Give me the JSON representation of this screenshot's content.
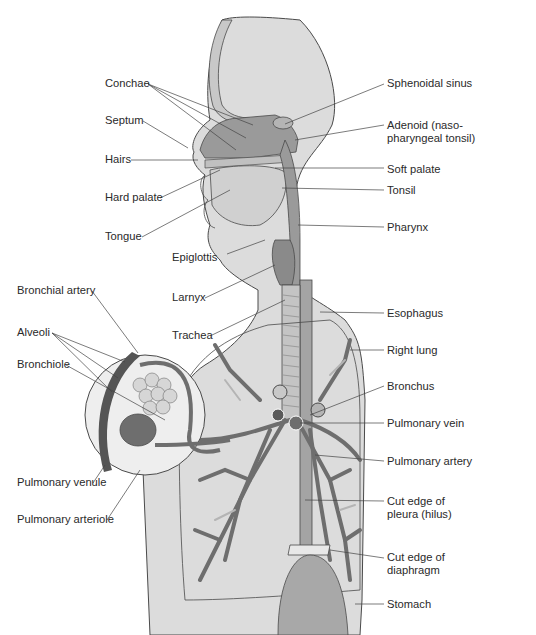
{
  "figure": {
    "colors": {
      "body_fill": "#dcdcdc",
      "outline": "#4a4a4a",
      "vessel_dark": "#6e6e6e",
      "vessel_light": "#b4b4b4",
      "tissue_mid": "#9a9a9a",
      "leader_line": "#444444"
    }
  },
  "labels": {
    "left": [
      {
        "id": "conchae",
        "text": "Conchae"
      },
      {
        "id": "septum",
        "text": "Septum"
      },
      {
        "id": "hairs",
        "text": "Hairs"
      },
      {
        "id": "hard_palate",
        "text": "Hard palate"
      },
      {
        "id": "tongue",
        "text": "Tongue"
      },
      {
        "id": "epiglottis",
        "text": "Epiglottis"
      },
      {
        "id": "larynx",
        "text": "Larnyx"
      },
      {
        "id": "trachea",
        "text": "Trachea"
      },
      {
        "id": "bronchial_artery",
        "text": "Bronchial artery"
      },
      {
        "id": "alveoli",
        "text": "Alveoli"
      },
      {
        "id": "bronchiole",
        "text": "Bronchiole"
      },
      {
        "id": "pulmonary_venule",
        "text": "Pulmonary venule"
      },
      {
        "id": "pulmonary_arteriole",
        "text": "Pulmonary arteriole"
      }
    ],
    "right": [
      {
        "id": "sphenoidal_sinus",
        "text": "Sphenoidal sinus"
      },
      {
        "id": "adenoid_1",
        "text": "Adenoid (naso-"
      },
      {
        "id": "adenoid_2",
        "text": "pharyngeal tonsil)"
      },
      {
        "id": "soft_palate",
        "text": "Soft palate"
      },
      {
        "id": "tonsil",
        "text": "Tonsil"
      },
      {
        "id": "pharynx",
        "text": "Pharynx"
      },
      {
        "id": "esophagus",
        "text": "Esophagus"
      },
      {
        "id": "right_lung",
        "text": "Right lung"
      },
      {
        "id": "bronchus",
        "text": "Bronchus"
      },
      {
        "id": "pulmonary_vein",
        "text": "Pulmonary vein"
      },
      {
        "id": "pulmonary_artery",
        "text": "Pulmonary artery"
      },
      {
        "id": "cut_edge_pleura_1",
        "text": "Cut edge of"
      },
      {
        "id": "cut_edge_pleura_2",
        "text": "pleura (hilus)"
      },
      {
        "id": "cut_edge_diaphragm_1",
        "text": "Cut edge of"
      },
      {
        "id": "cut_edge_diaphragm_2",
        "text": "diaphragm"
      },
      {
        "id": "stomach",
        "text": "Stomach"
      }
    ]
  }
}
